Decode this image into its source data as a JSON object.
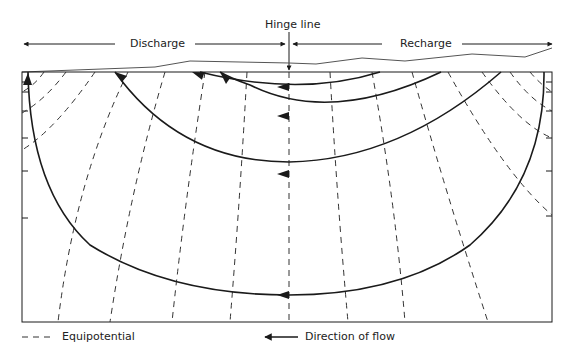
{
  "diagram": {
    "title_hinge": "Hinge line",
    "zone_left": "Discharge",
    "zone_right": "Recharge",
    "legend": {
      "equipotential_label": "Equipotential",
      "flow_label": "Direction of flow"
    },
    "colors": {
      "line": "#1a1a1a",
      "dashed": "#333333",
      "background": "#ffffff"
    },
    "elements": {
      "flow_lines_count": 4,
      "equipotential_lines": "dashed, radiating from flow system",
      "hinge_line_x": 289
    }
  }
}
